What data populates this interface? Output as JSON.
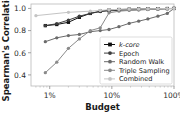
{
  "chart_data": {
    "type": "line",
    "title": "",
    "xlabel": "Budget",
    "ylabel": "Spearman's Correlation",
    "xscale": "log",
    "xlim": [
      0.005,
      1.0
    ],
    "ylim": [
      0.3,
      1.04
    ],
    "xticks": [
      0.01,
      0.1,
      1.0
    ],
    "xticklabels": [
      "1%",
      "10%",
      "100%"
    ],
    "yticks": [
      0.4,
      0.6,
      0.8,
      1.0
    ],
    "yticklabels": [
      "0.4",
      "0.6",
      "0.8",
      "1.0"
    ],
    "grid": false,
    "legend_position": "lower right",
    "series": [
      {
        "name": "k-core",
        "color": "#111111",
        "marker": "square",
        "x": [
          0.0085,
          0.013,
          0.02,
          0.03,
          0.045,
          0.065,
          0.09,
          0.13,
          0.19,
          0.27,
          0.38,
          0.55,
          0.78,
          1.0
        ],
        "y": [
          0.845,
          0.855,
          0.875,
          0.92,
          0.955,
          0.975,
          0.985,
          0.99,
          0.993,
          0.995,
          0.997,
          0.998,
          0.999,
          1.0
        ]
      },
      {
        "name": "Epoch",
        "color": "#3d3d3d",
        "marker": "circle",
        "x": [
          0.0085,
          0.013,
          0.02,
          0.03,
          0.045,
          0.065,
          0.09,
          0.13,
          0.19,
          0.27,
          0.38,
          0.55,
          0.78,
          1.0
        ],
        "y": [
          0.845,
          0.862,
          0.895,
          0.93,
          0.955,
          0.972,
          0.978,
          0.983,
          0.987,
          0.99,
          0.993,
          0.995,
          0.998,
          1.0
        ]
      },
      {
        "name": "Random Walk",
        "color": "#6b6b6b",
        "marker": "circle",
        "x": [
          0.0085,
          0.013,
          0.02,
          0.03,
          0.045,
          0.065,
          0.09,
          0.13,
          0.19,
          0.27,
          0.38,
          0.55,
          0.78,
          1.0
        ],
        "y": [
          0.7,
          0.735,
          0.755,
          0.765,
          0.79,
          0.8,
          0.81,
          0.835,
          0.865,
          0.885,
          0.905,
          0.93,
          0.955,
          1.0
        ]
      },
      {
        "name": "Triple Sampling",
        "color": "#8a8a8a",
        "marker": "circle",
        "x": [
          0.0085,
          0.013,
          0.02,
          0.03,
          0.045,
          0.065,
          0.09,
          0.13,
          0.19,
          0.27,
          0.38,
          0.55,
          0.78,
          1.0
        ],
        "y": [
          0.42,
          0.515,
          0.64,
          0.725,
          0.8,
          0.825,
          0.96,
          0.975,
          0.982,
          0.985,
          0.99,
          0.993,
          0.996,
          1.0
        ]
      },
      {
        "name": "Combined",
        "color": "#c4c4c4",
        "marker": "circle",
        "x": [
          0.006,
          0.02,
          0.045,
          0.065,
          0.09,
          0.13,
          0.19,
          0.27,
          0.38,
          0.55,
          0.78,
          1.0
        ],
        "y": [
          0.935,
          0.965,
          0.975,
          0.982,
          0.988,
          0.992,
          0.994,
          0.996,
          0.997,
          0.998,
          0.999,
          1.0
        ]
      }
    ]
  },
  "legend": {
    "entries": [
      {
        "label": "k-core"
      },
      {
        "label": "Epoch"
      },
      {
        "label": "Random Walk"
      },
      {
        "label": "Triple Sampling"
      },
      {
        "label": "Combined"
      }
    ]
  },
  "caption": {
    "text": ""
  }
}
